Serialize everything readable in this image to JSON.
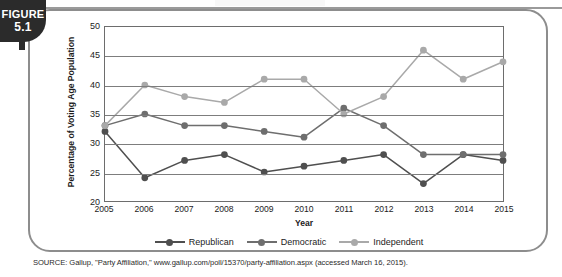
{
  "figure": {
    "tab_word": "FIGURE",
    "tab_number": "5.1"
  },
  "source": {
    "text": "SOURCE: Gallup, \"Party Affiliation,\" www.gallup.com/poll/15370/party-affiliation.aspx (accessed March 16, 2015)."
  },
  "colors": {
    "republican": "#4f4f4f",
    "democratic": "#6e6e6e",
    "independent": "#a9a9a9",
    "axis": "#6d6d6d",
    "grid": "#7d7d7d",
    "text": "#1c1c1c",
    "frame": "#8d8d8d",
    "tab_bg": "#2b2b2b"
  },
  "chart_data": {
    "type": "line",
    "title": "",
    "xlabel": "Year",
    "ylabel": "Percentage of Voting Age Population",
    "categories": [
      "2005",
      "2006",
      "2007",
      "2008",
      "2009",
      "2010",
      "2011",
      "2012",
      "2013",
      "2014",
      "2015"
    ],
    "x": [
      2005,
      2006,
      2007,
      2008,
      2009,
      2010,
      2011,
      2012,
      2013,
      2014,
      2015
    ],
    "ylim": [
      20,
      50
    ],
    "yticks": [
      20,
      25,
      30,
      35,
      40,
      45,
      50
    ],
    "ytick_labels": [
      "20",
      "25",
      "30",
      "35",
      "40",
      "45",
      "50"
    ],
    "grid": true,
    "legend_position": "bottom",
    "series": [
      {
        "name": "Republican",
        "color": "#4f4f4f",
        "values": [
          32,
          24,
          27,
          28,
          25,
          26,
          27,
          28,
          23,
          28,
          27
        ]
      },
      {
        "name": "Democratic",
        "color": "#6e6e6e",
        "values": [
          33,
          35,
          33,
          33,
          32,
          31,
          36,
          33,
          28,
          28,
          28
        ]
      },
      {
        "name": "Independent",
        "color": "#a9a9a9",
        "values": [
          33,
          40,
          38,
          37,
          41,
          41,
          35,
          38,
          46,
          41,
          44
        ]
      }
    ]
  }
}
